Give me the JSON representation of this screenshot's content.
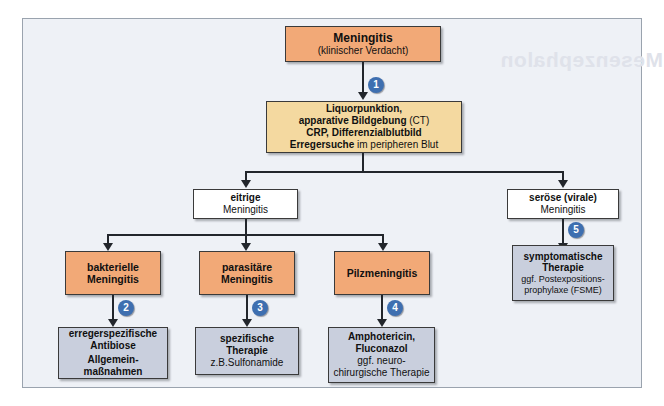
{
  "watermark_text": "Mesenzephalon",
  "boxes": {
    "meningitis": {
      "title": "Meningitis",
      "subtitle": "(klinischer Verdacht)"
    },
    "diagnostik": {
      "line1_bold": "Liquorpunktion,",
      "line2_bold": "apparative Bildgebung",
      "line2_plain": " (CT)",
      "line3_bold": "CRP, Differenzialblutbild",
      "line4_bold": "Erregersuche",
      "line4_plain": " im peripheren Blut"
    },
    "eitrige": {
      "title": "eitrige",
      "subtitle": "Meningitis"
    },
    "seroese": {
      "title": "seröse (virale)",
      "subtitle": "Meningitis"
    },
    "bakterielle": {
      "title": "bakterielle",
      "subtitle": "Meningitis"
    },
    "parasitaere": {
      "title": "parasitäre",
      "subtitle": "Meningitis"
    },
    "pilz": {
      "title": "Pilzmeningitis"
    },
    "symptomatische": {
      "title1": "symptomatische",
      "title2": "Therapie",
      "sub1": "ggf. Postexpositions-",
      "sub2": "prophylaxe (FSME)"
    },
    "antibiose": {
      "title1": "erregerspezifische",
      "title2": "Antibiose",
      "title3": "Allgemein-",
      "title4": "maßnahmen"
    },
    "spezifische": {
      "title1": "spezifische",
      "title2": "Therapie",
      "sub1": "z.B.Sulfonamide"
    },
    "antimykotika": {
      "title1": "Amphotericin,",
      "title2": "Fluconazol",
      "sub1": "ggf. neuro-",
      "sub2": "chirurgische Therapie"
    }
  },
  "badges": {
    "b1": "1",
    "b2": "2",
    "b3": "3",
    "b4": "4",
    "b5": "5"
  },
  "colors": {
    "orange": "#f2a977",
    "tan": "#f4d9a0",
    "blue": "#c9cfdd",
    "badge": "#3e6fb0",
    "line": "#22262c",
    "page_bg": "#eef1f6"
  }
}
